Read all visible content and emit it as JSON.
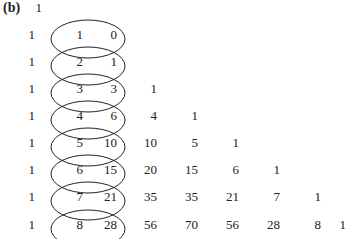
{
  "figure_label": "(b)",
  "triangle": {
    "rows": [
      [
        1
      ],
      [
        1,
        1,
        0
      ],
      [
        1,
        2,
        1
      ],
      [
        1,
        3,
        3,
        1
      ],
      [
        1,
        4,
        6,
        4,
        1
      ],
      [
        1,
        5,
        10,
        10,
        5,
        1
      ],
      [
        1,
        6,
        15,
        20,
        15,
        6,
        1
      ],
      [
        1,
        7,
        21,
        35,
        35,
        21,
        7,
        1
      ],
      [
        1,
        8,
        28,
        56,
        70,
        56,
        28,
        8,
        1
      ]
    ],
    "encircled_columns": [
      1,
      2
    ],
    "encircled_rows": [
      1,
      2,
      3,
      4,
      5,
      6,
      7,
      8
    ],
    "ellipse_count": 8
  },
  "colors": {
    "text": "#222222",
    "ellipse_stroke": "#222222",
    "background": "#ffffff"
  }
}
